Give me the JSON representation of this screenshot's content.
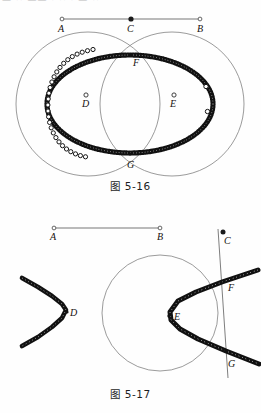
{
  "page": {
    "top_cut_text": "—  ··  —— · ··   ·  — ··",
    "background_color": "#fefefe",
    "ink_color": "#15100d",
    "thin_line_color": "#6b6b6b"
  },
  "figures": [
    {
      "id": "fig-5-16",
      "caption": "图 5-16",
      "description": "Two intersecting circles centered at D and E with a locus of traced points forming an ellipse through intersection points F and G; a control segment AB with midpoint C above.",
      "segment": {
        "name": "AB",
        "labels": {
          "a": "A",
          "b": "B",
          "c": "C"
        },
        "endpoint_style": "open-circle",
        "midpoint_style": "filled-dot"
      },
      "circle_centers": [
        {
          "label": "D",
          "style": "open-circle"
        },
        {
          "label": "E",
          "style": "open-circle"
        }
      ],
      "intersection_points": [
        {
          "label": "F"
        },
        {
          "label": "G"
        }
      ],
      "locus": {
        "type": "ellipse",
        "left_marker": "open-circle",
        "right_marker": "filled-dot"
      }
    },
    {
      "id": "fig-5-17",
      "caption": "图 5-17",
      "description": "A circle centered near the middle, a hyperbola branch opening right with vertex E meeting a slanted line at F and G; a second detached hyperbola branch opening left with vertex D; a control segment AB above with a movable point C on the slanted line.",
      "segment": {
        "name": "AB",
        "labels": {
          "a": "A",
          "b": "B"
        },
        "endpoint_style": "open-circle"
      },
      "point_c": {
        "label": "C",
        "style": "filled-dot"
      },
      "curve_vertices": [
        {
          "label": "D",
          "style": "filled-dot"
        },
        {
          "label": "E",
          "style": "filled-dot"
        }
      ],
      "intersection_points": [
        {
          "label": "F"
        },
        {
          "label": "G"
        }
      ]
    }
  ]
}
